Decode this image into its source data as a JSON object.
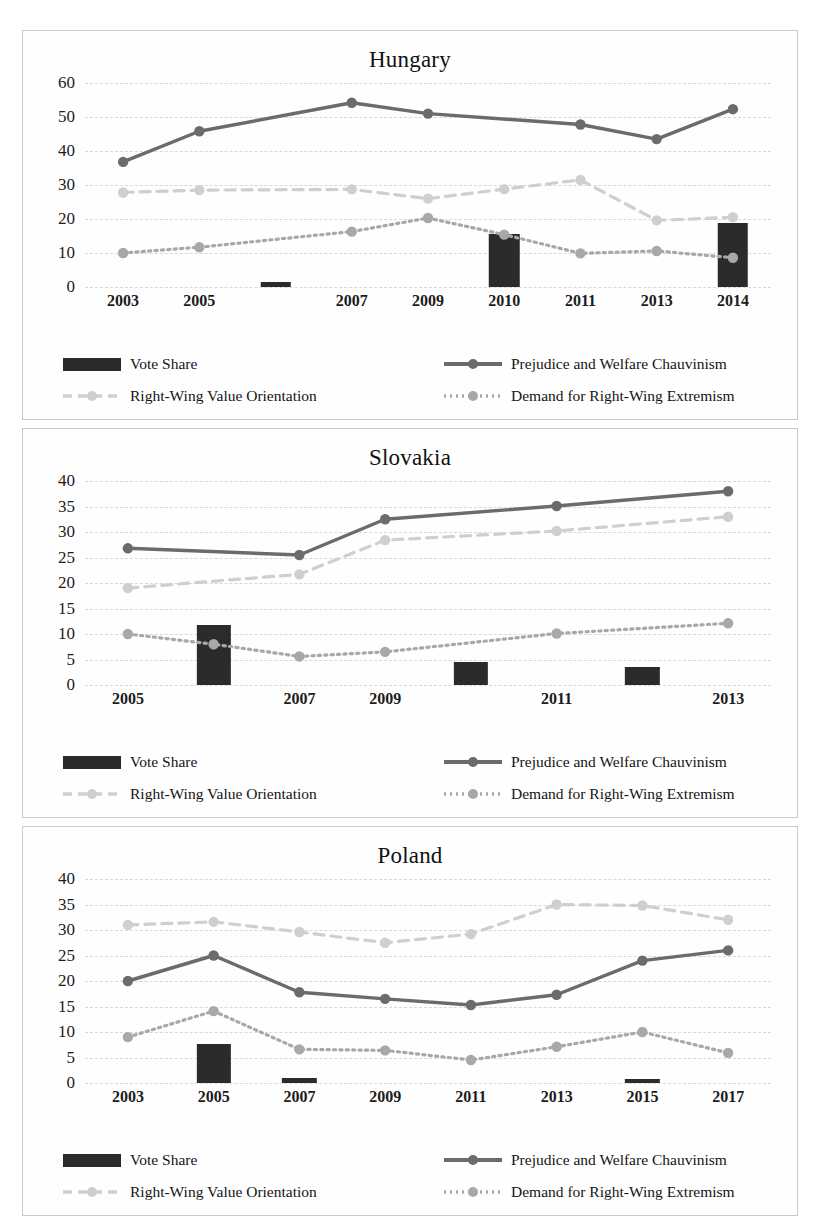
{
  "legend": {
    "vote_share": "Vote Share",
    "prejudice": "Prejudice and Welfare Chauvinism",
    "rwvo": "Right-Wing Value Orientation",
    "drwe": "Demand for Right-Wing Extremism"
  },
  "colors": {
    "vote_share": "#2b2b2b",
    "prejudice": "#6b6b6b",
    "rwvo": "#cfcfcf",
    "drwe": "#a8a8a8",
    "grid": "#d8d8d8",
    "panel_border": "#c9c9c9"
  },
  "panels": [
    {
      "title": "Hungary"
    },
    {
      "title": "Slovakia"
    },
    {
      "title": "Poland"
    }
  ],
  "chart_data": [
    {
      "type": "line",
      "title": "Hungary",
      "xlabel": "",
      "ylabel": "",
      "ylim": [
        0,
        60
      ],
      "yticks": [
        0,
        10,
        20,
        30,
        40,
        50,
        60
      ],
      "grid": true,
      "legend_position": "bottom",
      "categories": [
        "2003",
        "2005",
        "2006",
        "2007",
        "2009",
        "2010",
        "2011",
        "2013",
        "2014"
      ],
      "tick_labels": [
        "2003",
        "2005",
        "",
        "2007",
        "2009",
        "2010",
        "2011",
        "2013",
        "2014"
      ],
      "series": [
        {
          "name": "Vote Share",
          "type": "bar",
          "values": [
            null,
            null,
            1.6,
            null,
            null,
            15.5,
            null,
            null,
            18.8
          ]
        },
        {
          "name": "Prejudice and Welfare Chauvinism",
          "type": "line",
          "values": [
            36.8,
            45.8,
            null,
            54.2,
            51.0,
            null,
            47.8,
            43.5,
            52.3
          ]
        },
        {
          "name": "Right-Wing Value Orientation",
          "type": "line",
          "values": [
            27.8,
            28.5,
            null,
            28.7,
            26.0,
            28.8,
            31.5,
            19.6,
            20.5
          ]
        },
        {
          "name": "Demand for Right-Wing Extremism",
          "type": "line",
          "values": [
            10.0,
            11.7,
            null,
            16.3,
            20.3,
            15.4,
            9.9,
            10.6,
            8.6
          ]
        }
      ]
    },
    {
      "type": "line",
      "title": "Slovakia",
      "xlabel": "",
      "ylabel": "",
      "ylim": [
        0,
        40
      ],
      "yticks": [
        0,
        5,
        10,
        15,
        20,
        25,
        30,
        35,
        40
      ],
      "grid": true,
      "legend_position": "bottom",
      "categories": [
        "2005",
        "2006",
        "2007",
        "2009",
        "2010",
        "2011",
        "2012",
        "2013"
      ],
      "tick_labels": [
        "2005",
        "",
        "2007",
        "2009",
        "",
        "2011",
        "",
        "2013"
      ],
      "series": [
        {
          "name": "Vote Share",
          "type": "bar",
          "values": [
            null,
            11.7,
            null,
            null,
            4.6,
            null,
            3.6,
            null
          ]
        },
        {
          "name": "Prejudice and Welfare Chauvinism",
          "type": "line",
          "values": [
            26.8,
            null,
            25.5,
            32.5,
            null,
            35.1,
            null,
            38.0
          ]
        },
        {
          "name": "Right-Wing Value Orientation",
          "type": "line",
          "values": [
            19.0,
            null,
            21.7,
            28.4,
            null,
            30.2,
            null,
            33.0
          ]
        },
        {
          "name": "Demand for Right-Wing Extremism",
          "type": "line",
          "values": [
            10.0,
            8.0,
            5.6,
            6.5,
            null,
            10.1,
            null,
            12.1
          ]
        }
      ]
    },
    {
      "type": "line",
      "title": "Poland",
      "xlabel": "",
      "ylabel": "",
      "ylim": [
        0,
        40
      ],
      "yticks": [
        0,
        5,
        10,
        15,
        20,
        25,
        30,
        35,
        40
      ],
      "grid": true,
      "legend_position": "bottom",
      "categories": [
        "2003",
        "2005",
        "2007",
        "2009",
        "2011",
        "2013",
        "2015",
        "2017"
      ],
      "tick_labels": [
        "2003",
        "2005",
        "2007",
        "2009",
        "2011",
        "2013",
        "2015",
        "2017"
      ],
      "series": [
        {
          "name": "Vote Share",
          "type": "bar",
          "values": [
            null,
            7.7,
            1.0,
            null,
            null,
            null,
            0.8,
            null
          ]
        },
        {
          "name": "Prejudice and Welfare Chauvinism",
          "type": "line",
          "values": [
            20.0,
            25.0,
            17.8,
            16.5,
            15.3,
            17.3,
            24.0,
            26.0
          ]
        },
        {
          "name": "Right-Wing Value Orientation",
          "type": "line",
          "values": [
            31.0,
            31.6,
            29.6,
            27.5,
            29.2,
            35.0,
            34.8,
            32.0
          ]
        },
        {
          "name": "Demand for Right-Wing Extremism",
          "type": "line",
          "values": [
            9.0,
            14.1,
            6.6,
            6.4,
            4.5,
            7.1,
            10.0,
            5.9
          ]
        }
      ]
    }
  ]
}
